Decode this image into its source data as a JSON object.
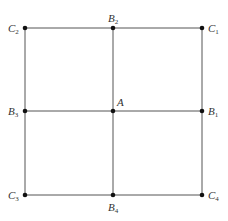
{
  "diagram": {
    "type": "grid-square",
    "line_color": "#555555",
    "point_color": "#111111",
    "points": [
      {
        "id": "C2",
        "base": "C",
        "sub": "2",
        "x": 25,
        "y": 28,
        "label_pos": "left"
      },
      {
        "id": "B2",
        "base": "B",
        "sub": "2",
        "x": 113,
        "y": 28,
        "label_pos": "top"
      },
      {
        "id": "C1",
        "base": "C",
        "sub": "1",
        "x": 202,
        "y": 28,
        "label_pos": "right"
      },
      {
        "id": "B3",
        "base": "B",
        "sub": "3",
        "x": 25,
        "y": 111,
        "label_pos": "left"
      },
      {
        "id": "A",
        "base": "A",
        "sub": "",
        "x": 113,
        "y": 111,
        "label_pos": "top-right"
      },
      {
        "id": "B1",
        "base": "B",
        "sub": "1",
        "x": 202,
        "y": 111,
        "label_pos": "right"
      },
      {
        "id": "C3",
        "base": "C",
        "sub": "3",
        "x": 25,
        "y": 195,
        "label_pos": "left"
      },
      {
        "id": "B4",
        "base": "B",
        "sub": "4",
        "x": 113,
        "y": 195,
        "label_pos": "bottom"
      },
      {
        "id": "C4",
        "base": "C",
        "sub": "4",
        "x": 202,
        "y": 195,
        "label_pos": "right"
      }
    ],
    "segments": [
      [
        "C2",
        "C1"
      ],
      [
        "B3",
        "B1"
      ],
      [
        "C3",
        "C4"
      ],
      [
        "C2",
        "C3"
      ],
      [
        "B2",
        "B4"
      ],
      [
        "C1",
        "C4"
      ]
    ]
  }
}
